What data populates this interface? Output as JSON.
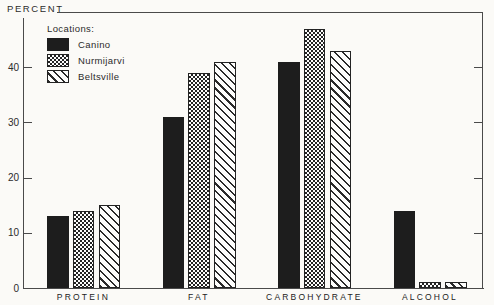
{
  "figure": {
    "background": "#fbfaf7",
    "ink": "#2b2b2b",
    "bar_black": "#1d1d1d"
  },
  "chart_data": {
    "type": "bar",
    "title": "",
    "xlabel": "",
    "ylabel": "PERCENT",
    "ylim": [
      0,
      50
    ],
    "yticks": [
      0,
      10,
      20,
      30,
      40
    ],
    "grid": false,
    "legend_title": "Locations:",
    "legend_position": "top-left",
    "categories": [
      "PROTEIN",
      "FAT",
      "CARBOHYDRATE",
      "ALCOHOL"
    ],
    "series": [
      {
        "name": "Canino",
        "fill": "solid-black",
        "values": [
          13,
          31,
          41,
          14
        ]
      },
      {
        "name": "Nurmijarvi",
        "fill": "checkerboard",
        "values": [
          14,
          39,
          47,
          1
        ]
      },
      {
        "name": "Beltsville",
        "fill": "diagonal-hatch",
        "values": [
          15,
          41,
          43,
          1
        ]
      }
    ]
  }
}
